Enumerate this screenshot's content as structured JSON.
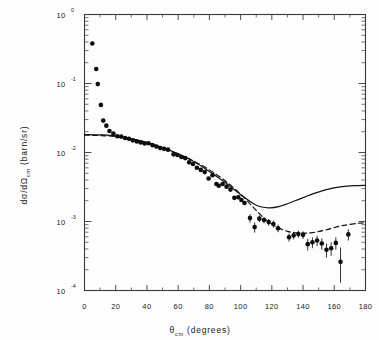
{
  "chart_data": {
    "type": "scatter",
    "title": "",
    "xlabel": "θcm (degrees)",
    "xlabel_parts": {
      "symbol": "θ",
      "subscript": "cm",
      "units": "(degrees)"
    },
    "ylabel": "dσ/dΩcm (barn/sr)",
    "ylabel_parts": {
      "prefix": "dσ/dΩ",
      "subscript": "cm",
      "units": "(barn/sr)"
    },
    "xscale": "linear",
    "yscale": "log",
    "xlim": [
      0,
      180
    ],
    "ylim": [
      0.0001,
      1.0
    ],
    "grid": false,
    "legend": "none",
    "xticks": [
      0,
      20,
      40,
      60,
      80,
      100,
      120,
      140,
      160,
      180
    ],
    "xtick_labels": [
      "0",
      "20",
      "40",
      "60",
      "80",
      "100",
      "120",
      "140",
      "160",
      "180"
    ],
    "yticks": [
      1.0,
      0.1,
      0.01,
      0.001,
      0.0001
    ],
    "ytick_labels": [
      "10 0",
      "10-1",
      "10-2",
      "10-3",
      "10-4"
    ],
    "ytick_mantissa": [
      "10",
      "10",
      "10",
      "10",
      "10"
    ],
    "ytick_exponents": [
      "0",
      "-1",
      "-2",
      "-3",
      "-4"
    ],
    "minor_ticks": "log decades 2-9 on y axis, 10 degree intervals on x axis",
    "series": [
      {
        "name": "experimental-data",
        "marker": "filled-circle",
        "points": [
          {
            "x": 5.0,
            "y": 0.38,
            "err_lo": 0,
            "err_hi": 0
          },
          {
            "x": 7.5,
            "y": 0.162,
            "err_lo": 0,
            "err_hi": 0
          },
          {
            "x": 8.5,
            "y": 0.098,
            "err_lo": 0,
            "err_hi": 0
          },
          {
            "x": 10.5,
            "y": 0.049,
            "err_lo": 0,
            "err_hi": 0
          },
          {
            "x": 12.0,
            "y": 0.029,
            "err_lo": 0,
            "err_hi": 0
          },
          {
            "x": 14.0,
            "y": 0.0245,
            "err_lo": 0,
            "err_hi": 0
          },
          {
            "x": 16.0,
            "y": 0.0205,
            "err_lo": 0,
            "err_hi": 0
          },
          {
            "x": 18.5,
            "y": 0.0188,
            "err_lo": 0,
            "err_hi": 0
          },
          {
            "x": 21.0,
            "y": 0.0172,
            "err_lo": 0,
            "err_hi": 0
          },
          {
            "x": 23.5,
            "y": 0.017,
            "err_lo": 0,
            "err_hi": 0
          },
          {
            "x": 26.0,
            "y": 0.0162,
            "err_lo": 0,
            "err_hi": 0
          },
          {
            "x": 28.5,
            "y": 0.0158,
            "err_lo": 0,
            "err_hi": 0
          },
          {
            "x": 31.0,
            "y": 0.015,
            "err_lo": 0,
            "err_hi": 0
          },
          {
            "x": 33.5,
            "y": 0.0144,
            "err_lo": 0,
            "err_hi": 0
          },
          {
            "x": 36.0,
            "y": 0.014,
            "err_lo": 0,
            "err_hi": 0
          },
          {
            "x": 38.5,
            "y": 0.0135,
            "err_lo": 0,
            "err_hi": 0
          },
          {
            "x": 41.0,
            "y": 0.0136,
            "err_lo": 0,
            "err_hi": 0
          },
          {
            "x": 43.5,
            "y": 0.0128,
            "err_lo": 0,
            "err_hi": 0
          },
          {
            "x": 46.0,
            "y": 0.0122,
            "err_lo": 0,
            "err_hi": 0
          },
          {
            "x": 48.5,
            "y": 0.0116,
            "err_lo": 0,
            "err_hi": 0
          },
          {
            "x": 51.0,
            "y": 0.0113,
            "err_lo": 0,
            "err_hi": 0
          },
          {
            "x": 53.5,
            "y": 0.011,
            "err_lo": 0,
            "err_hi": 0
          },
          {
            "x": 57.0,
            "y": 0.0094,
            "err_lo": 0,
            "err_hi": 0
          },
          {
            "x": 59.5,
            "y": 0.0092,
            "err_lo": 0,
            "err_hi": 0
          },
          {
            "x": 62.0,
            "y": 0.0086,
            "err_lo": 0,
            "err_hi": 0
          },
          {
            "x": 64.5,
            "y": 0.0083,
            "err_lo": 0,
            "err_hi": 0
          },
          {
            "x": 67.0,
            "y": 0.0072,
            "err_lo": 0,
            "err_hi": 0
          },
          {
            "x": 69.5,
            "y": 0.0068,
            "err_lo": 0,
            "err_hi": 0
          },
          {
            "x": 72.0,
            "y": 0.006,
            "err_lo": 0,
            "err_hi": 0
          },
          {
            "x": 74.5,
            "y": 0.0056,
            "err_lo": 0,
            "err_hi": 0
          },
          {
            "x": 77.0,
            "y": 0.0052,
            "err_lo": 0,
            "err_hi": 0
          },
          {
            "x": 79.5,
            "y": 0.0042,
            "err_lo": 0,
            "err_hi": 0
          },
          {
            "x": 82.0,
            "y": 0.0047,
            "err_lo": 0,
            "err_hi": 0
          },
          {
            "x": 84.5,
            "y": 0.0035,
            "err_lo": 0,
            "err_hi": 0
          },
          {
            "x": 86.0,
            "y": 0.0033,
            "err_lo": 0,
            "err_hi": 0
          },
          {
            "x": 88.5,
            "y": 0.0035,
            "err_lo": 0,
            "err_hi": 0
          },
          {
            "x": 91.0,
            "y": 0.0032,
            "err_lo": 0,
            "err_hi": 0
          },
          {
            "x": 93.5,
            "y": 0.0029,
            "err_lo": 0,
            "err_hi": 0
          },
          {
            "x": 96.0,
            "y": 0.0022,
            "err_lo": 0,
            "err_hi": 0
          },
          {
            "x": 98.5,
            "y": 0.00225,
            "err_lo": 0,
            "err_hi": 0
          },
          {
            "x": 100.5,
            "y": 0.00205,
            "err_lo": 0,
            "err_hi": 0
          },
          {
            "x": 102.5,
            "y": 0.00185,
            "err_lo": 0,
            "err_hi": 0
          },
          {
            "x": 106.0,
            "y": 0.00112,
            "err_lo": 0.00016,
            "err_hi": 0.00016
          },
          {
            "x": 109.0,
            "y": 0.00083,
            "err_lo": 0.00014,
            "err_hi": 0.00014
          },
          {
            "x": 112.0,
            "y": 0.0011,
            "err_lo": 0.00012,
            "err_hi": 0.00012
          },
          {
            "x": 115.0,
            "y": 0.00105,
            "err_lo": 0.00011,
            "err_hi": 0.00011
          },
          {
            "x": 118.0,
            "y": 0.00098,
            "err_lo": 0.00011,
            "err_hi": 0.00011
          },
          {
            "x": 121.0,
            "y": 0.00092,
            "err_lo": 0.00011,
            "err_hi": 0.00011
          },
          {
            "x": 124.0,
            "y": 0.0008,
            "err_lo": 0.0001,
            "err_hi": 0.0001
          },
          {
            "x": 131.0,
            "y": 0.00059,
            "err_lo": 8e-05,
            "err_hi": 8e-05
          },
          {
            "x": 134.0,
            "y": 0.00063,
            "err_lo": 8e-05,
            "err_hi": 8e-05
          },
          {
            "x": 137.0,
            "y": 0.00066,
            "err_lo": 8e-05,
            "err_hi": 8e-05
          },
          {
            "x": 140.0,
            "y": 0.00064,
            "err_lo": 8e-05,
            "err_hi": 8e-05
          },
          {
            "x": 143.0,
            "y": 0.00047,
            "err_lo": 9e-05,
            "err_hi": 9e-05
          },
          {
            "x": 146.0,
            "y": 0.0005,
            "err_lo": 9e-05,
            "err_hi": 9e-05
          },
          {
            "x": 149.0,
            "y": 0.00053,
            "err_lo": 9e-05,
            "err_hi": 9e-05
          },
          {
            "x": 152.0,
            "y": 0.00048,
            "err_lo": 9e-05,
            "err_hi": 9e-05
          },
          {
            "x": 155.0,
            "y": 0.00039,
            "err_lo": 9e-05,
            "err_hi": 9e-05
          },
          {
            "x": 158.0,
            "y": 0.00041,
            "err_lo": 9e-05,
            "err_hi": 9e-05
          },
          {
            "x": 161.0,
            "y": 0.00049,
            "err_lo": 0.0001,
            "err_hi": 0.0001
          },
          {
            "x": 164.0,
            "y": 0.00026,
            "err_lo": 0.00013,
            "err_hi": 0.00016
          },
          {
            "x": 169.0,
            "y": 0.00065,
            "err_lo": 0.00012,
            "err_hi": 0.00012
          }
        ]
      },
      {
        "name": "theory-curve-solid",
        "style": "solid",
        "points": [
          {
            "x": 0,
            "y": 0.0182
          },
          {
            "x": 10,
            "y": 0.018
          },
          {
            "x": 20,
            "y": 0.0174
          },
          {
            "x": 30,
            "y": 0.0158
          },
          {
            "x": 40,
            "y": 0.014
          },
          {
            "x": 50,
            "y": 0.0118
          },
          {
            "x": 60,
            "y": 0.0096
          },
          {
            "x": 70,
            "y": 0.0074
          },
          {
            "x": 80,
            "y": 0.0053
          },
          {
            "x": 90,
            "y": 0.0037
          },
          {
            "x": 100,
            "y": 0.00245
          },
          {
            "x": 110,
            "y": 0.00172
          },
          {
            "x": 118,
            "y": 0.00158
          },
          {
            "x": 125,
            "y": 0.00166
          },
          {
            "x": 135,
            "y": 0.002
          },
          {
            "x": 145,
            "y": 0.00245
          },
          {
            "x": 155,
            "y": 0.0029
          },
          {
            "x": 165,
            "y": 0.0032
          },
          {
            "x": 175,
            "y": 0.00332
          },
          {
            "x": 180,
            "y": 0.00335
          }
        ]
      },
      {
        "name": "theory-curve-dashed",
        "style": "dashed",
        "points": [
          {
            "x": 0,
            "y": 0.0178
          },
          {
            "x": 10,
            "y": 0.0176
          },
          {
            "x": 20,
            "y": 0.017
          },
          {
            "x": 30,
            "y": 0.0156
          },
          {
            "x": 40,
            "y": 0.0138
          },
          {
            "x": 50,
            "y": 0.0116
          },
          {
            "x": 60,
            "y": 0.0095
          },
          {
            "x": 70,
            "y": 0.0075
          },
          {
            "x": 80,
            "y": 0.0056
          },
          {
            "x": 90,
            "y": 0.0039
          },
          {
            "x": 100,
            "y": 0.0025
          },
          {
            "x": 108,
            "y": 0.00162
          },
          {
            "x": 115,
            "y": 0.00112
          },
          {
            "x": 122,
            "y": 0.00086
          },
          {
            "x": 130,
            "y": 0.00072
          },
          {
            "x": 138,
            "y": 0.00068
          },
          {
            "x": 146,
            "y": 0.00069
          },
          {
            "x": 155,
            "y": 0.00076
          },
          {
            "x": 165,
            "y": 0.00087
          },
          {
            "x": 175,
            "y": 0.00094
          },
          {
            "x": 180,
            "y": 0.00096
          }
        ]
      }
    ]
  },
  "axes": {
    "x_symbol": "θ",
    "x_subscript": "cm",
    "x_units": "(degrees)",
    "y_prefix": "dσ/dΩ",
    "y_subscript": "cm",
    "y_units": "(barn/sr)"
  },
  "colors": {
    "background": "#fdfdfd",
    "ink": "#141414",
    "frame": "#3a3a3a"
  }
}
